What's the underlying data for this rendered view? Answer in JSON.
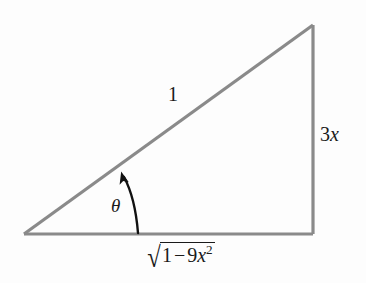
{
  "figure": {
    "kind": "right-triangle-trig-diagram",
    "background_color": "#fdfdfd",
    "stroke_color": "#8a8a8a",
    "text_color": "#1a1a1a",
    "arc_color": "#111111",
    "vertices": {
      "left": [
        24,
        234
      ],
      "bottom_right": [
        313,
        234
      ],
      "top_right": [
        313,
        25
      ]
    },
    "labels": {
      "hypotenuse": "1",
      "opposite_coefficient": "3",
      "opposite_variable": "x",
      "angle": "θ",
      "adjacent_surd": "√",
      "adjacent_one": "1",
      "adjacent_operator": "−",
      "adjacent_coefficient": "9",
      "adjacent_variable": "x",
      "adjacent_exponent": "2"
    }
  }
}
